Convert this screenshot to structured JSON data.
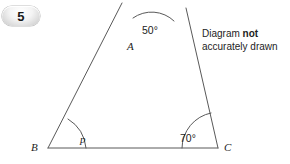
{
  "question": {
    "number": "5"
  },
  "note": {
    "line1_prefix": "Diagram ",
    "line1_bold": "not",
    "line2": "accurately drawn"
  },
  "figure": {
    "type": "geometry-triangle-with-extended-sides",
    "vertices": [
      {
        "name": "A",
        "label": "A",
        "x": 148,
        "y": 47
      },
      {
        "name": "B",
        "label": "B",
        "x": 48,
        "y": 148
      },
      {
        "name": "C",
        "label": "C",
        "x": 218,
        "y": 148
      }
    ],
    "extensions": [
      {
        "name": "extension-above-A-left",
        "from_vertex": "A",
        "x": 122,
        "y": 3
      },
      {
        "name": "extension-above-A-right",
        "from_vertex": "A",
        "x": 186,
        "y": 8
      }
    ],
    "angles": [
      {
        "name": "angle-at-A-vertical",
        "label": "50°",
        "value": 50,
        "at": "A",
        "position": "above-vertex-between-extensions"
      },
      {
        "name": "angle-at-B",
        "label": "p",
        "value": null,
        "at": "B",
        "position": "interior"
      },
      {
        "name": "angle-at-C",
        "label": "70°",
        "value": 70,
        "at": "C",
        "position": "interior"
      }
    ],
    "colors": {
      "stroke": "#595959",
      "label": "#1d1d1d",
      "background": "#ffffff"
    }
  }
}
